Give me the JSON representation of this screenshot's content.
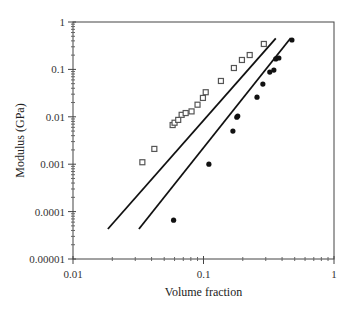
{
  "chart_data": {
    "type": "scatter",
    "title": "",
    "xlabel": "Volume fraction",
    "ylabel": "Modulus (GPa)",
    "xscale": "log",
    "yscale": "log",
    "xlim": [
      0.01,
      1
    ],
    "ylim": [
      1e-05,
      1
    ],
    "xticks": [
      "0.01",
      "0.1",
      "1"
    ],
    "yticks": [
      "1",
      "0.1",
      "0.01",
      "0.001",
      "0.0001",
      "0.00001"
    ],
    "grid": false,
    "legend": null,
    "series": [
      {
        "name": "open squares",
        "marker": "open-square",
        "color": "#555555",
        "points": [
          [
            0.034,
            0.0011
          ],
          [
            0.042,
            0.0021
          ],
          [
            0.058,
            0.0067
          ],
          [
            0.06,
            0.0075
          ],
          [
            0.064,
            0.0086
          ],
          [
            0.068,
            0.011
          ],
          [
            0.073,
            0.012
          ],
          [
            0.081,
            0.013
          ],
          [
            0.09,
            0.018
          ],
          [
            0.099,
            0.025
          ],
          [
            0.104,
            0.033
          ],
          [
            0.136,
            0.057
          ],
          [
            0.171,
            0.107
          ],
          [
            0.197,
            0.158
          ],
          [
            0.226,
            0.201
          ],
          [
            0.29,
            0.344
          ]
        ]
      },
      {
        "name": "filled circles",
        "marker": "filled-circle",
        "color": "#111111",
        "points": [
          [
            0.059,
            6.6e-05
          ],
          [
            0.11,
            0.001
          ],
          [
            0.168,
            0.005
          ],
          [
            0.18,
            0.0098
          ],
          [
            0.183,
            0.0104
          ],
          [
            0.257,
            0.026
          ],
          [
            0.285,
            0.049
          ],
          [
            0.322,
            0.088
          ],
          [
            0.346,
            0.097
          ],
          [
            0.358,
            0.166
          ],
          [
            0.378,
            0.174
          ],
          [
            0.476,
            0.417
          ]
        ]
      }
    ],
    "lines": [
      {
        "name": "fit line 1",
        "color": "#111111",
        "from": [
          0.0185,
          4.3e-05
        ],
        "to": [
          0.358,
          0.45
        ]
      },
      {
        "name": "fit line 2",
        "color": "#111111",
        "from": [
          0.032,
          4.3e-05
        ],
        "to": [
          0.466,
          0.46
        ]
      }
    ]
  },
  "layout": {
    "plot": {
      "left": 73,
      "right": 334,
      "top": 22,
      "bottom": 259
    }
  }
}
